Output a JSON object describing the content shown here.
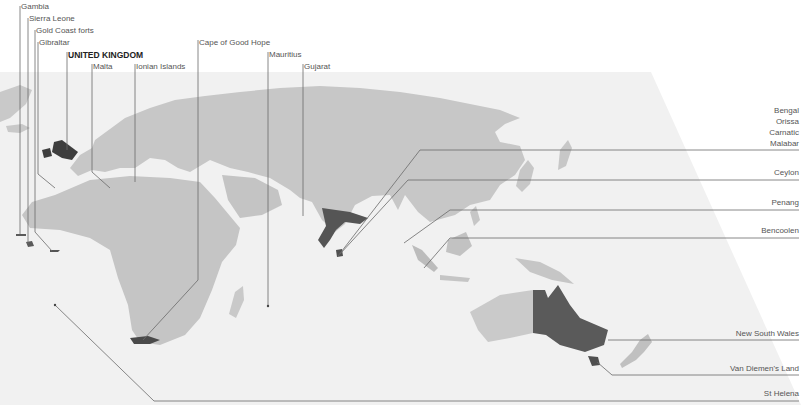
{
  "map": {
    "title": "British Empire territories (c. 1815)",
    "colors": {
      "background": "#ffffff",
      "plane": "#f1f1f1",
      "land": "#c7c7c7",
      "land_shadow": "#b3b3b3",
      "highlight": "#4f4f4f",
      "leader_line": "#6a6a6a",
      "label_text": "#555555"
    },
    "labels_top": [
      {
        "id": "gambia",
        "text": "Gambia",
        "x": 21,
        "y": 6,
        "bold": false
      },
      {
        "id": "sierra-leone",
        "text": "Sierra Leone",
        "x": 29,
        "y": 18,
        "bold": false
      },
      {
        "id": "gold-coast-forts",
        "text": "Gold Coast forts",
        "x": 36,
        "y": 30,
        "bold": false
      },
      {
        "id": "gibraltar",
        "text": "Gibraltar",
        "x": 39,
        "y": 42,
        "bold": false
      },
      {
        "id": "united-kingdom",
        "text": "UNITED KINGDOM",
        "x": 68,
        "y": 52,
        "bold": true
      },
      {
        "id": "malta",
        "text": "Malta",
        "x": 93,
        "y": 64,
        "bold": false
      },
      {
        "id": "ionian-islands",
        "text": "Ionian Islands",
        "x": 136,
        "y": 64,
        "bold": false
      },
      {
        "id": "cape-of-good-hope",
        "text": "Cape of Good Hope",
        "x": 199,
        "y": 40,
        "bold": false
      },
      {
        "id": "mauritius",
        "text": "Mauritius",
        "x": 269,
        "y": 52,
        "bold": false
      },
      {
        "id": "gujarat",
        "text": "Gujarat",
        "x": 304,
        "y": 64,
        "bold": false
      }
    ],
    "labels_right": [
      {
        "id": "bengal",
        "text": "Bengal",
        "y": 109
      },
      {
        "id": "orissa",
        "text": "Orissa",
        "y": 120
      },
      {
        "id": "carnatic",
        "text": "Carnatic",
        "y": 131
      },
      {
        "id": "malabar",
        "text": "Malabar",
        "y": 142
      },
      {
        "id": "ceylon",
        "text": "Ceylon",
        "y": 170
      },
      {
        "id": "penang",
        "text": "Penang",
        "y": 200
      },
      {
        "id": "bencoolen",
        "text": "Bencoolen",
        "y": 228
      },
      {
        "id": "new-south-wales",
        "text": "New South Wales",
        "y": 330
      },
      {
        "id": "van-diemens-land",
        "text": "Van Diemen's Land",
        "y": 365
      },
      {
        "id": "st-helena",
        "text": "St Helena",
        "y": 390
      }
    ]
  }
}
